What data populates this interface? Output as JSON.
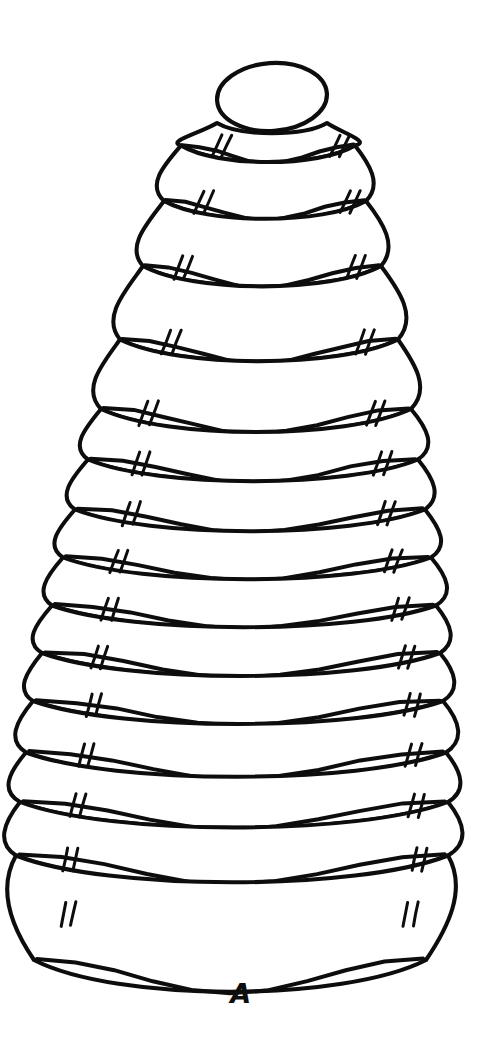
{
  "figure": {
    "label": "A",
    "style": "black ink line drawing on white background",
    "background_color": "#ffffff",
    "ink_color": "#0d0d0d",
    "canvas": {
      "width": 482,
      "height": 1039
    },
    "apex": {
      "name": "apex-cap",
      "center_x": 272,
      "center_y": 97,
      "radius_x": 55,
      "radius_y": 34,
      "rotation_deg": -4
    },
    "whorl_count": 15,
    "tick_pair_count_per_whorl": 2,
    "whorls": [
      {
        "index": 1,
        "center_x": 268,
        "suture_y": 152,
        "half_width": 87,
        "bulge": 16,
        "sag": 13,
        "tick_left_x": 222,
        "tick_right_x": 340,
        "tick_y": 135,
        "tick_len": 21,
        "tick_slant": 10
      },
      {
        "index": 2,
        "center_x": 265,
        "suture_y": 208,
        "half_width": 101,
        "bulge": 17,
        "sag": 14,
        "tick_left_x": 204,
        "tick_right_x": 350,
        "tick_y": 191,
        "tick_len": 22,
        "tick_slant": 10
      },
      {
        "index": 3,
        "center_x": 262,
        "suture_y": 274,
        "half_width": 119,
        "bulge": 18,
        "sag": 16,
        "tick_left_x": 183,
        "tick_right_x": 355,
        "tick_y": 256,
        "tick_len": 23,
        "tick_slant": 9
      },
      {
        "index": 4,
        "center_x": 259,
        "suture_y": 348,
        "half_width": 139,
        "bulge": 19,
        "sag": 17,
        "tick_left_x": 171,
        "tick_right_x": 364,
        "tick_y": 330,
        "tick_len": 24,
        "tick_slant": 9
      },
      {
        "index": 5,
        "center_x": 256,
        "suture_y": 418,
        "half_width": 155,
        "bulge": 19,
        "sag": 18,
        "tick_left_x": 148,
        "tick_right_x": 375,
        "tick_y": 401,
        "tick_len": 24,
        "tick_slant": 9
      },
      {
        "index": 6,
        "center_x": 253,
        "suture_y": 468,
        "half_width": 165,
        "bulge": 18,
        "sag": 17,
        "tick_left_x": 140,
        "tick_right_x": 382,
        "tick_y": 452,
        "tick_len": 23,
        "tick_slant": 8
      },
      {
        "index": 7,
        "center_x": 250,
        "suture_y": 518,
        "half_width": 175,
        "bulge": 18,
        "sag": 17,
        "tick_left_x": 130,
        "tick_right_x": 385,
        "tick_y": 502,
        "tick_len": 23,
        "tick_slant": 8
      },
      {
        "index": 8,
        "center_x": 247,
        "suture_y": 566,
        "half_width": 184,
        "bulge": 18,
        "sag": 17,
        "tick_left_x": 118,
        "tick_right_x": 392,
        "tick_y": 550,
        "tick_len": 22,
        "tick_slant": 8
      },
      {
        "index": 9,
        "center_x": 244,
        "suture_y": 614,
        "half_width": 192,
        "bulge": 18,
        "sag": 17,
        "tick_left_x": 108,
        "tick_right_x": 399,
        "tick_y": 598,
        "tick_len": 22,
        "tick_slant": 7
      },
      {
        "index": 10,
        "center_x": 241,
        "suture_y": 662,
        "half_width": 199,
        "bulge": 18,
        "sag": 18,
        "tick_left_x": 98,
        "tick_right_x": 405,
        "tick_y": 646,
        "tick_len": 22,
        "tick_slant": 7
      },
      {
        "index": 11,
        "center_x": 238,
        "suture_y": 710,
        "half_width": 205,
        "bulge": 18,
        "sag": 18,
        "tick_left_x": 92,
        "tick_right_x": 410,
        "tick_y": 694,
        "tick_len": 22,
        "tick_slant": 6
      },
      {
        "index": 12,
        "center_x": 236,
        "suture_y": 762,
        "half_width": 210,
        "bulge": 19,
        "sag": 19,
        "tick_left_x": 84,
        "tick_right_x": 412,
        "tick_y": 744,
        "tick_len": 22,
        "tick_slant": 6
      },
      {
        "index": 13,
        "center_x": 234,
        "suture_y": 812,
        "half_width": 214,
        "bulge": 19,
        "sag": 20,
        "tick_left_x": 76,
        "tick_right_x": 414,
        "tick_y": 794,
        "tick_len": 23,
        "tick_slant": 6
      },
      {
        "index": 14,
        "center_x": 232,
        "suture_y": 866,
        "half_width": 216,
        "bulge": 20,
        "sag": 21,
        "tick_left_x": 68,
        "tick_right_x": 417,
        "tick_y": 848,
        "tick_len": 23,
        "tick_slant": 5
      },
      {
        "index": 15,
        "center_x": 230,
        "suture_y": 972,
        "half_width": 196,
        "bulge": 22,
        "sag": 24,
        "tick_left_x": 66,
        "tick_right_x": 408,
        "tick_y": 902,
        "tick_len": 24,
        "tick_slant": 5
      }
    ]
  }
}
